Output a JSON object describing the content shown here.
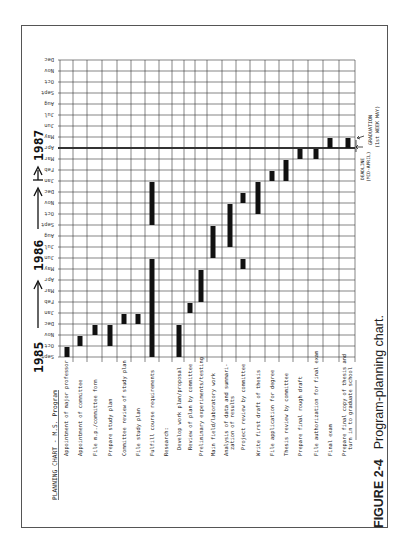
{
  "figure": {
    "label": "FIGURE 2-4",
    "caption": "Program-planning chart."
  },
  "chart_data": {
    "type": "gantt",
    "title": "PLANNING CHART - M.S. Program",
    "orientation": "rotated 90° counter-clockwise (tasks run left→right as columns, months run bottom→top)",
    "time_axis": {
      "months": [
        "Sept",
        "Oct",
        "Nov",
        "Dec",
        "Jan",
        "Feb",
        "Mar",
        "Apr",
        "May",
        "Jun",
        "Jul",
        "Aug",
        "Sept",
        "Oct",
        "Nov",
        "Dec",
        "Jan",
        "Feb",
        "Mar",
        "Apr",
        "May",
        "Jun",
        "Jul",
        "Aug",
        "Sept",
        "Oct",
        "Nov",
        "Dec"
      ],
      "year_markers": [
        "1985",
        "1986",
        "1987"
      ],
      "start": "Sept 1985",
      "end": "Dec 1987"
    },
    "tasks": [
      {
        "name": "Appointment of major professor",
        "start": "Sept 1985",
        "end": "Sept 1985"
      },
      {
        "name": "Appointment of committee",
        "start": "Oct 1985",
        "end": "Oct 1985"
      },
      {
        "name": "File m.p./committee form",
        "start": "Nov 1985",
        "end": "Nov 1985"
      },
      {
        "name": "Prepare study plan",
        "start": "Oct 1985",
        "end": "Nov 1985"
      },
      {
        "name": "Committee review of study plan",
        "start": "Dec 1985",
        "end": "Dec 1985"
      },
      {
        "name": "File study plan",
        "start": "Dec 1985",
        "end": "Dec 1985"
      },
      {
        "name": "Fulfill course requirements",
        "start": "Sept 1985",
        "end": "May 1986",
        "second_start": "Sept 1986",
        "second_end": "Dec 1986"
      },
      {
        "name": "Research:",
        "header": true
      },
      {
        "name": "Develop work plan/proposal",
        "start": "Sept 1985",
        "end": "Nov 1985"
      },
      {
        "name": "Review of plan by committee",
        "start": "Jan 1986",
        "end": "Jan 1986"
      },
      {
        "name": "Preliminary experiments/testing",
        "start": "Feb 1986",
        "end": "Apr 1986"
      },
      {
        "name": "Main field/laboratory work",
        "start": "Jun 1986",
        "end": "Aug 1986"
      },
      {
        "name": "Analysis of data and summarization of results",
        "start": "Jul 1986",
        "end": "Oct 1986"
      },
      {
        "name": "Project review by committee",
        "start": "May 1986",
        "end": "May 1986",
        "second_start": "Nov 1986",
        "second_end": "Nov 1986"
      },
      {
        "name": "Write first draft of thesis",
        "start": "Oct 1986",
        "end": "Dec 1986"
      },
      {
        "name": "File application for degree",
        "start": "Jan 1987",
        "end": "Jan 1987"
      },
      {
        "name": "Thesis review by committee",
        "start": "Jan 1987",
        "end": "Feb 1987"
      },
      {
        "name": "Prepare final rough draft",
        "start": "Mar 1987",
        "end": "Mar 1987"
      },
      {
        "name": "File authorization for final exam",
        "start": "Mar 1987",
        "end": "Mar 1987"
      },
      {
        "name": "Final exam",
        "start": "Apr 1987",
        "end": "Apr 1987"
      },
      {
        "name": "Prepare final copy of thesis and turn in to graduate school",
        "start": "Apr 1987",
        "end": "Apr 1987"
      }
    ],
    "annotations": [
      {
        "text": "DEADLINE (MID-APRIL)",
        "at": "Apr 1987"
      },
      {
        "text": "GRADUATION (1st WEEK MAY)",
        "at": "May 1987"
      }
    ],
    "grid": true
  },
  "labels": {
    "title": "PLANNING CHART - M.S. Program",
    "tasks": [
      "Appointment of major professor",
      "Appointment of committee",
      "File m.p./committee form",
      "Prepare study plan",
      "Committee review of study plan",
      "File study plan",
      "Fulfill course requirements",
      "Research:",
      "Develop work plan/proposal",
      "Review of plan by committee",
      "Preliminary experiments/testing",
      "Main field/laboratory work",
      "Analysis of data and summari-",
      "zation of results",
      "Project review by committee",
      "Write first draft of thesis",
      "File application for degree",
      "Thesis review by committee",
      "Prepare final rough draft",
      "File authorization for final exam",
      "Final exam",
      "Prepare final copy of thesis and",
      "turn in to graduate school"
    ],
    "months": [
      "Sept",
      "Oct",
      "Nov",
      "Dec",
      "Jan",
      "Feb",
      "Mar",
      "Apr",
      "May",
      "Jun",
      "Jul",
      "Aug",
      "Sept",
      "Oct",
      "Nov",
      "Dec",
      "Jan",
      "Feb",
      "Mar",
      "Apr",
      "May",
      "Jun",
      "Jul",
      "Aug",
      "Sept",
      "Oct",
      "Nov",
      "Dec"
    ],
    "years": [
      "1985",
      "1986",
      "1987"
    ],
    "deadline": "DEADLINE",
    "deadline_sub": "(MID-APRIL)",
    "graduation": "GRADUATION",
    "graduation_sub": "(1st WEEK MAY)"
  }
}
